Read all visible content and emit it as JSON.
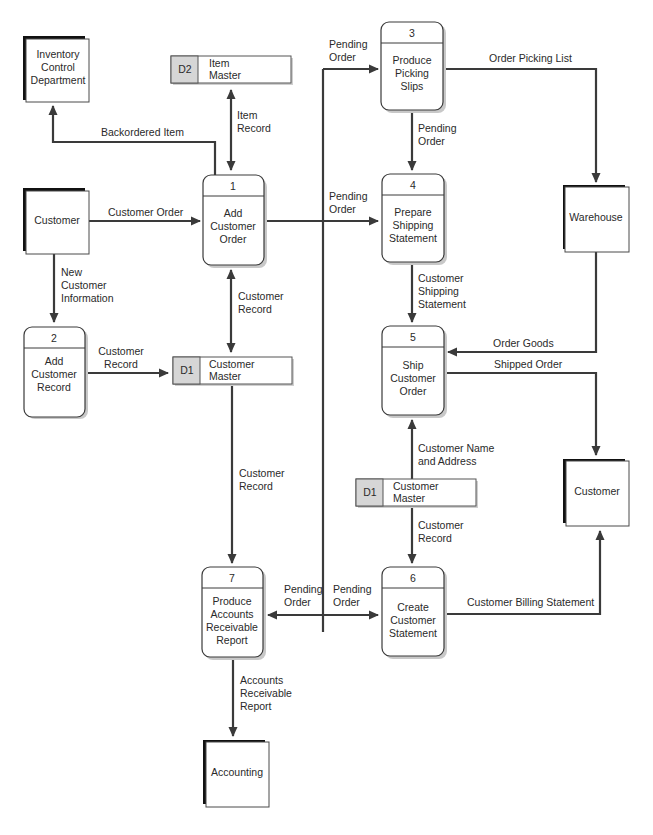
{
  "diagram": {
    "type": "data-flow-diagram",
    "external_entities": [
      {
        "id": "inventory",
        "lines": [
          "Inventory",
          "Control",
          "Department"
        ]
      },
      {
        "id": "customer_left",
        "lines": [
          "Customer"
        ]
      },
      {
        "id": "warehouse",
        "lines": [
          "Warehouse"
        ]
      },
      {
        "id": "customer_right",
        "lines": [
          "Customer"
        ]
      },
      {
        "id": "accounting",
        "lines": [
          "Accounting"
        ]
      }
    ],
    "processes": [
      {
        "number": "1",
        "lines": [
          "Add",
          "Customer",
          "Order"
        ]
      },
      {
        "number": "2",
        "lines": [
          "Add",
          "Customer",
          "Record"
        ]
      },
      {
        "number": "3",
        "lines": [
          "Produce",
          "Picking",
          "Slips"
        ]
      },
      {
        "number": "4",
        "lines": [
          "Prepare",
          "Shipping",
          "Statement"
        ]
      },
      {
        "number": "5",
        "lines": [
          "Ship",
          "Customer",
          "Order"
        ]
      },
      {
        "number": "6",
        "lines": [
          "Create",
          "Customer",
          "Statement"
        ]
      },
      {
        "number": "7",
        "lines": [
          "Produce",
          "Accounts",
          "Receivable",
          "Report"
        ]
      }
    ],
    "data_stores": [
      {
        "id": "D2",
        "lines": [
          "Item",
          "Master"
        ]
      },
      {
        "id": "D1",
        "lines": [
          "Customer",
          "Master"
        ]
      },
      {
        "id": "D1",
        "lines": [
          "Customer",
          "Master"
        ]
      }
    ],
    "flows": {
      "backordered_item": [
        "Backordered Item"
      ],
      "item_record": [
        "Item",
        "Record"
      ],
      "customer_order": [
        "Customer Order"
      ],
      "new_customer_info": [
        "New",
        "Customer",
        "Information"
      ],
      "customer_record_p1": [
        "Customer",
        "Record"
      ],
      "customer_record_p2": [
        "Customer",
        "Record"
      ],
      "pending_order_p3": [
        "Pending",
        "Order"
      ],
      "pending_order_p4": [
        "Pending",
        "Order"
      ],
      "pending_order_3to4": [
        "Pending",
        "Order"
      ],
      "order_picking_list": [
        "Order Picking List"
      ],
      "customer_shipping_statement": [
        "Customer",
        "Shipping",
        "Statement"
      ],
      "order_goods": [
        "Order Goods"
      ],
      "shipped_order": [
        "Shipped Order"
      ],
      "customer_name_address": [
        "Customer Name",
        "and Address"
      ],
      "customer_record_d1_to_p6": [
        "Customer",
        "Record"
      ],
      "customer_record_d1_to_p7": [
        "Customer",
        "Record"
      ],
      "pending_order_p7": [
        "Pending",
        "Order"
      ],
      "pending_order_p6": [
        "Pending",
        "Order"
      ],
      "customer_billing_statement": [
        "Customer Billing Statement"
      ],
      "accounts_receivable_report": [
        "Accounts",
        "Receivable",
        "Report"
      ]
    }
  }
}
